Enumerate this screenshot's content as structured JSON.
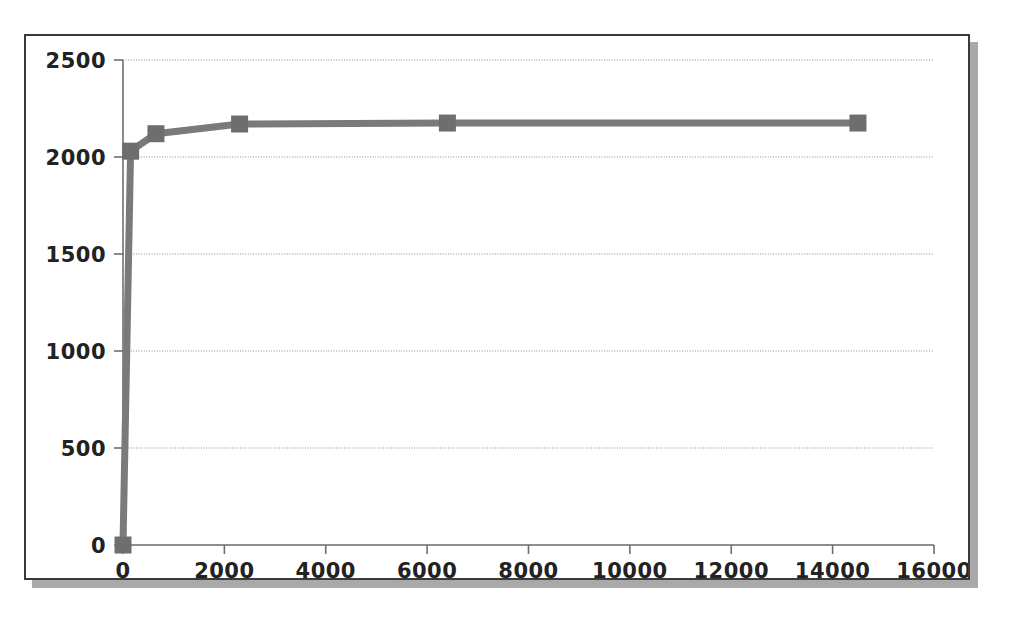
{
  "chart_data": {
    "type": "line",
    "title": "",
    "subtitle": "",
    "xlabel": "",
    "ylabel": "",
    "xlim": [
      0,
      16000
    ],
    "ylim": [
      0,
      2500
    ],
    "grid": true,
    "legend": false,
    "legend_position": "none",
    "x_ticks": [
      0,
      2000,
      4000,
      6000,
      8000,
      10000,
      12000,
      14000,
      16000
    ],
    "x_tick_labels": [
      "0",
      "2000",
      "4000",
      "6000",
      "8000",
      "10000",
      "12000",
      "14000",
      "16000"
    ],
    "y_ticks": [
      0,
      500,
      1000,
      1500,
      2000,
      2500
    ],
    "y_tick_labels": [
      "0",
      "500",
      "1000",
      "1500",
      "2000",
      "2500"
    ],
    "marker": "square",
    "marker_color": "#6e6e6e",
    "line_color": "#7a7a7a",
    "series": [
      {
        "name": "series-1",
        "x": [
          0,
          150,
          650,
          2300,
          6400,
          14500
        ],
        "values": [
          0,
          2030,
          2120,
          2170,
          2175,
          2175
        ],
        "points": [
          {
            "x": 0,
            "y": 0
          },
          {
            "x": 150,
            "y": 2030
          },
          {
            "x": 650,
            "y": 2120
          },
          {
            "x": 2300,
            "y": 2170
          },
          {
            "x": 6400,
            "y": 2175
          },
          {
            "x": 14500,
            "y": 2175
          }
        ]
      }
    ]
  },
  "figure": {
    "background": "#ffffff",
    "frame_border_color": "#3a3a3a",
    "shadow_color": "#a9a9a9"
  }
}
